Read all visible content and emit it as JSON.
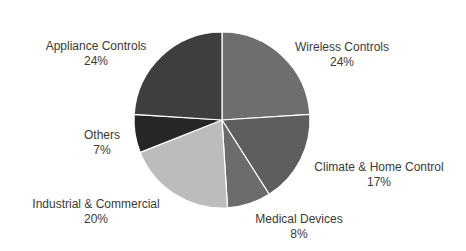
{
  "chart_data": {
    "type": "pie",
    "title": "",
    "categories": [
      "Wireless Controls",
      "Climate & Home Control",
      "Medical Devices",
      "Industrial & Commercial",
      "Others",
      "Appliance Controls"
    ],
    "values": [
      24,
      17,
      8,
      20,
      7,
      24
    ],
    "unit": "%",
    "colors": [
      "#6e6e6e",
      "#5e5e5e",
      "#6c6c6c",
      "#bcbcbc",
      "#262626",
      "#3e3e3e"
    ],
    "start_angle": "12 o'clock",
    "direction": "clockwise",
    "legend": "none (data labels outside slices)",
    "slice_separator_color": "#ffffff"
  },
  "labels": [
    {
      "name": "Wireless Controls",
      "pct": "24%",
      "x": 342,
      "y1": 51,
      "y2": 66
    },
    {
      "name": "Climate & Home Control",
      "pct": "17%",
      "x": 379,
      "y1": 171,
      "y2": 186
    },
    {
      "name": "Medical Devices",
      "pct": "8%",
      "x": 299,
      "y1": 223,
      "y2": 238
    },
    {
      "name": "Industrial & Commercial",
      "pct": "20%",
      "x": 96,
      "y1": 208,
      "y2": 223
    },
    {
      "name": "Others",
      "pct": "7%",
      "x": 102,
      "y1": 139,
      "y2": 154
    },
    {
      "name": "Appliance Controls",
      "pct": "24%",
      "x": 96,
      "y1": 50,
      "y2": 65
    }
  ]
}
